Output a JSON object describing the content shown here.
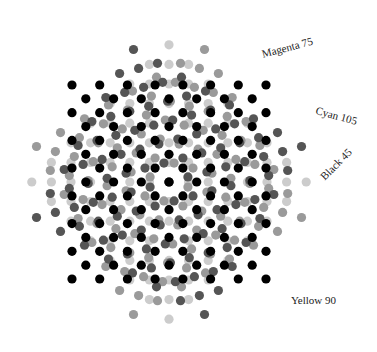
{
  "center": {
    "x": 169,
    "y": 182
  },
  "dot_spacing": 19.6,
  "dot_radius": 4.6,
  "extent": 152,
  "screens": [
    {
      "name": "Yellow",
      "angle": 90,
      "color": "#cccccc",
      "label": "Yellow 90",
      "label_pos": {
        "x": 291,
        "y": 294
      },
      "label_rotate": 0
    },
    {
      "name": "Cyan",
      "angle": 105,
      "color": "#9a9a9a",
      "label": "Cyan 105",
      "label_pos": {
        "x": 316,
        "y": 104
      },
      "label_rotate": 15
    },
    {
      "name": "Magenta",
      "angle": 75,
      "color": "#555555",
      "label": "Magenta 75",
      "label_pos": {
        "x": 262,
        "y": 48
      },
      "label_rotate": -15
    },
    {
      "name": "Black",
      "angle": 45,
      "color": "#000000",
      "label": "Black 45",
      "label_pos": {
        "x": 322,
        "y": 172
      },
      "label_rotate": -45
    }
  ]
}
